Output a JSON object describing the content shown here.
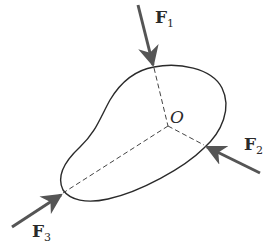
{
  "diagram": {
    "point": {
      "label": "O"
    },
    "forces": [
      {
        "id": "F1",
        "symbol": "F",
        "subscript": "1"
      },
      {
        "id": "F2",
        "symbol": "F",
        "subscript": "2"
      },
      {
        "id": "F3",
        "symbol": "F",
        "subscript": "3"
      }
    ],
    "colors": {
      "outline": "#2a2a2a",
      "arrow": "#555555",
      "dashed": "#444444"
    }
  }
}
